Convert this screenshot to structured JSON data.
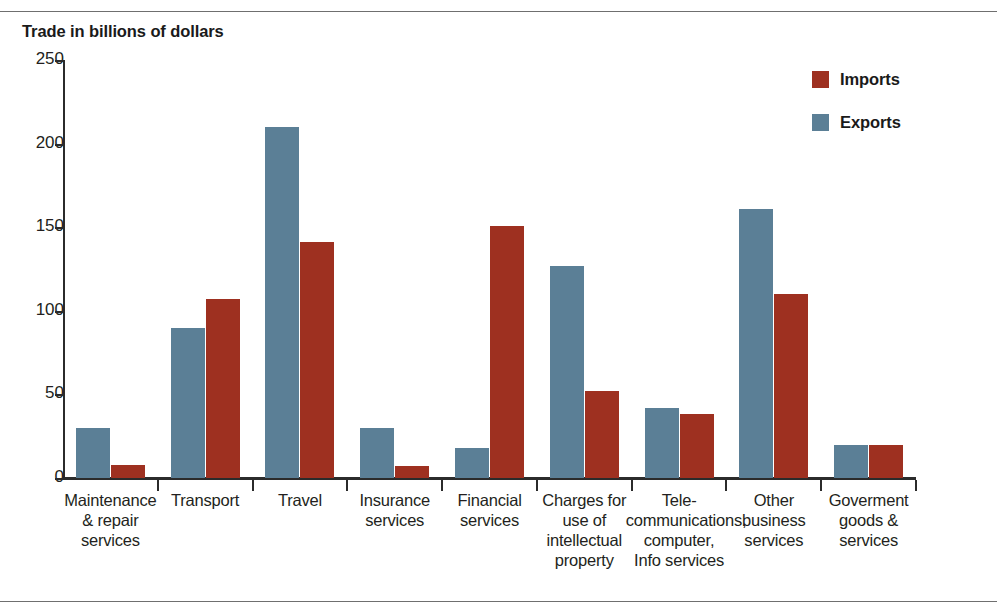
{
  "chart_data": {
    "type": "bar",
    "title": "Trade in billions of dollars",
    "xlabel": "",
    "ylabel": "",
    "ylim": [
      0,
      250
    ],
    "yticks": [
      0,
      50,
      100,
      150,
      200,
      250
    ],
    "ytick_labels": [
      "0",
      "50",
      "100",
      "150",
      "200",
      "250"
    ],
    "grid": false,
    "legend_position": "top-right",
    "categories": [
      "Maintenance & repair services",
      "Transport",
      "Travel",
      "Insurance services",
      "Financial services",
      "Charges for use of intellectual property",
      "Tele-communications, computer, Info services",
      "Other business services",
      "Goverment goods & services"
    ],
    "category_label_lines": [
      [
        "Maintenance",
        "& repair",
        "services"
      ],
      [
        "Transport"
      ],
      [
        "Travel"
      ],
      [
        "Insurance",
        "services"
      ],
      [
        "Financial",
        "services"
      ],
      [
        "Charges for",
        "use of",
        "intellectual",
        "property"
      ],
      [
        "Tele-",
        "communications,",
        "computer,",
        "Info services"
      ],
      [
        "Other",
        "business",
        "services"
      ],
      [
        "Goverment",
        "goods &",
        "services"
      ]
    ],
    "series": [
      {
        "name": "Exports",
        "color": "#5b7f96",
        "values": [
          30,
          90,
          210,
          30,
          18,
          127,
          42,
          161,
          20
        ]
      },
      {
        "name": "Imports",
        "color": "#9e3020",
        "values": [
          8,
          107,
          141,
          7,
          151,
          52,
          38,
          110,
          20
        ]
      }
    ]
  },
  "legend": {
    "entries": [
      {
        "label": "Imports",
        "color": "#9e3020",
        "swatch": "imports-swatch"
      },
      {
        "label": "Exports",
        "color": "#5b7f96",
        "swatch": "exports-swatch"
      }
    ]
  },
  "colors": {
    "imports": "#9e3020",
    "exports": "#5b7f96",
    "axis": "#2b2b2b",
    "text": "#231f20",
    "rule": "#6f6f6f",
    "background": "#ffffff"
  }
}
